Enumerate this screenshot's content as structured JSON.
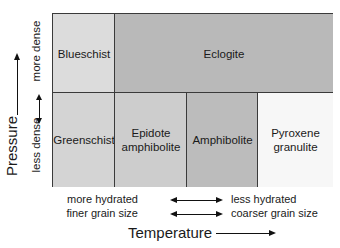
{
  "diagram": {
    "y_axis": {
      "label": "Pressure",
      "upper_label": "more dense",
      "lower_label": "less dense"
    },
    "x_axis": {
      "label": "Temperature",
      "row1": {
        "left": "more hydrated",
        "right": "less hydrated"
      },
      "row2": {
        "left": "finer grain size",
        "right": "coarser grain size"
      }
    },
    "cells": {
      "blueschist": {
        "label": "Blueschist",
        "color": "#dcdcdc"
      },
      "eclogite": {
        "label": "Eclogite",
        "color": "#b9b9b9"
      },
      "greenschist": {
        "label": "Greenschist",
        "color": "#d4d4d4"
      },
      "epidote_amphibolite": {
        "label1": "Epidote",
        "label2": "amphibolite",
        "color": "#cdcdcd"
      },
      "amphibolite": {
        "label": "Amphibolite",
        "color": "#bcbcbc"
      },
      "pyroxene_granulite": {
        "label1": "Pyroxene",
        "label2": "granulite",
        "color": "#f7f7f7"
      }
    }
  }
}
